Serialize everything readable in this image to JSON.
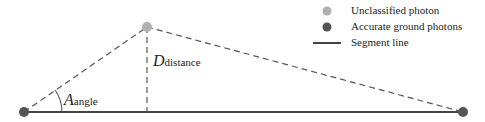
{
  "diagram": {
    "points": {
      "left": {
        "x": 24,
        "y": 112,
        "type": "accurate_ground"
      },
      "top": {
        "x": 147,
        "y": 27,
        "type": "unclassified"
      },
      "right": {
        "x": 463,
        "y": 112,
        "type": "accurate_ground"
      }
    },
    "labels": {
      "angle_main": "A",
      "angle_sub": "angle",
      "distance_main": "D",
      "distance_sub": "distance"
    },
    "colors": {
      "unclassified": "#b0b0b0",
      "accurate_ground": "#555555",
      "line": "#444444"
    }
  },
  "legend": {
    "items": [
      {
        "label": "Unclassified photon",
        "marker": "light-gray-dot"
      },
      {
        "label": "Accurate ground photons",
        "marker": "dark-gray-dot"
      },
      {
        "label": "Segment line",
        "marker": "solid-line"
      }
    ]
  }
}
